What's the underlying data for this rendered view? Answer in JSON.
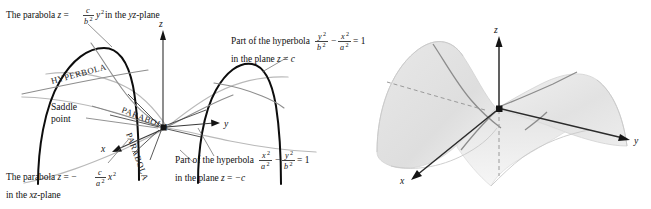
{
  "figure": {
    "panels": [
      "left-labeled-diagram",
      "right-shaded-surface"
    ]
  },
  "captions": {
    "top_left": {
      "prefix": "The parabola ",
      "var_z": "z",
      "equals": " = ",
      "frac_num": "c",
      "frac_den": "b",
      "frac_den_sup": "2",
      "var_y": "y",
      "y_sup": "2",
      "suffix": " in the ",
      "plane": "yz",
      "plane_tail": "-plane"
    },
    "bottom_left": {
      "prefix": "The parabola ",
      "var_z": "z",
      "equals": " = ",
      "minus": "−",
      "frac_num": "c",
      "frac_den": "a",
      "frac_den_sup": "2",
      "var_x": "x",
      "x_sup": "2",
      "line2_a": "in the ",
      "line2_plane": "xz",
      "line2_b": "-plane"
    },
    "top_right": {
      "prefix": "Part of the hyperbola ",
      "t1_num": "y",
      "t1_num_sup": "2",
      "t1_den": "b",
      "t1_den_sup": "2",
      "minus": "−",
      "t2_num": "x",
      "t2_num_sup": "2",
      "t2_den": "a",
      "t2_den_sup": "2",
      "equals": "= 1",
      "line2_a": "in the plane ",
      "line2_z": "z",
      "line2_b": " = ",
      "line2_c": "c"
    },
    "bottom_right": {
      "prefix": "Part of the hyperbola ",
      "t1_num": "x",
      "t1_num_sup": "2",
      "t1_den": "a",
      "t1_den_sup": "2",
      "minus": "−",
      "t2_num": "y",
      "t2_num_sup": "2",
      "t2_den": "b",
      "t2_den_sup": "2",
      "equals": "= 1",
      "line2_a": "in the plane ",
      "line2_z": "z",
      "line2_b": " = ",
      "line2_c": "−c"
    }
  },
  "annotations": {
    "saddle_line1": "Saddle",
    "saddle_line2": "point",
    "curve_label_hyperbola": "HYPERBOLA",
    "curve_label_parabola_upper": "PARABOLA",
    "curve_label_parabola_lower": "PARABOLA"
  },
  "axes": {
    "left_panel": {
      "x": "x",
      "y": "y",
      "z": "z"
    },
    "right_panel": {
      "x": "x",
      "y": "y",
      "z": "z"
    }
  },
  "colors": {
    "background": "#ffffff",
    "black_curve": "#0d0d0d",
    "gray_curve": "#b9b9b9",
    "mid_curve": "#8e8e8e",
    "axis": "#3a3a3a",
    "leader": "#6f6f6f",
    "surface_fill_light": "#ececec",
    "surface_fill_mid": "#dcdcdc",
    "text": "#111111"
  }
}
